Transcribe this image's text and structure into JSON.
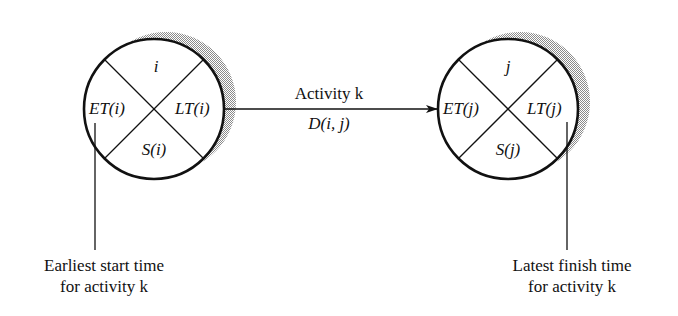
{
  "diagram": {
    "type": "activity-on-arrow network node notation",
    "colors": {
      "ink": "#111111",
      "shadow": "#b8b8b8",
      "background": "#ffffff"
    },
    "node_i": {
      "top": "i",
      "left": "ET(i)",
      "right": "LT(i)",
      "bottom": "S(i)"
    },
    "node_j": {
      "top": "j",
      "left": "ET(j)",
      "right": "LT(j)",
      "bottom": "S(j)"
    },
    "arrow": {
      "label_top": "Activity k",
      "label_bottom": "D(i, j)"
    },
    "callouts": {
      "left_line1": "Earliest start time",
      "left_line2": "for activity k",
      "right_line1": "Latest finish time",
      "right_line2": "for activity k"
    }
  }
}
